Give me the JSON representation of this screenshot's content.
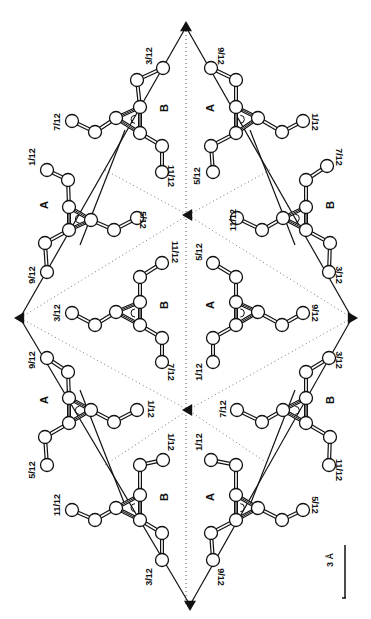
{
  "figure": {
    "width": 371,
    "height": 619
  },
  "axes_3fold": [
    {
      "x": 186,
      "y": 27,
      "dir": "up"
    },
    {
      "x": 20,
      "y": 318,
      "dir": "left"
    },
    {
      "x": 352,
      "y": 318,
      "dir": "right"
    },
    {
      "x": 188,
      "y": 215,
      "dir": "left"
    },
    {
      "x": 188,
      "y": 410,
      "dir": "left"
    },
    {
      "x": 190,
      "y": 605,
      "dir": "down"
    }
  ],
  "cell_lines": [
    [
      186,
      27,
      20,
      318
    ],
    [
      186,
      27,
      352,
      318
    ],
    [
      20,
      318,
      190,
      605
    ],
    [
      352,
      318,
      190,
      605
    ],
    [
      125,
      130,
      80,
      245
    ],
    [
      250,
      130,
      295,
      245
    ],
    [
      80,
      390,
      125,
      505
    ],
    [
      295,
      390,
      250,
      505
    ]
  ],
  "symmetry_lines": [
    [
      186,
      27,
      186,
      605
    ],
    [
      20,
      318,
      188,
      215
    ],
    [
      352,
      318,
      188,
      215
    ],
    [
      20,
      318,
      188,
      410
    ],
    [
      352,
      318,
      188,
      410
    ],
    [
      105,
      170,
      188,
      215
    ],
    [
      270,
      170,
      188,
      215
    ],
    [
      105,
      465,
      188,
      410
    ],
    [
      270,
      465,
      188,
      410
    ]
  ],
  "molecules": [
    {
      "id": "top-left-B",
      "label": "B",
      "labelPos": [
        168,
        108
      ],
      "core": [
        140,
        120
      ],
      "flip": 1,
      "rot": 0,
      "atoms": [
        [
          163,
          68
        ],
        [
          137,
          80
        ],
        [
          140,
          107
        ],
        [
          116,
          118
        ],
        [
          95,
          132
        ],
        [
          72,
          121
        ],
        [
          140,
          133
        ],
        [
          162,
          146
        ],
        [
          162,
          172
        ]
      ],
      "bonds": [
        [
          0,
          1
        ],
        [
          1,
          2
        ],
        [
          2,
          3
        ],
        [
          3,
          4
        ],
        [
          4,
          5
        ],
        [
          2,
          6
        ],
        [
          3,
          6
        ],
        [
          6,
          7
        ],
        [
          7,
          8
        ]
      ]
    },
    {
      "id": "top-right-A",
      "label": "A",
      "labelPos": [
        214,
        108
      ],
      "core": [
        238,
        120
      ],
      "flip": -1,
      "rot": 0,
      "atoms": [
        [
          211,
          68
        ],
        [
          236,
          80
        ],
        [
          236,
          107
        ],
        [
          258,
          118
        ],
        [
          282,
          132
        ],
        [
          303,
          121
        ],
        [
          236,
          133
        ],
        [
          211,
          146
        ],
        [
          213,
          172
        ]
      ],
      "bonds": [
        [
          0,
          1
        ],
        [
          1,
          2
        ],
        [
          2,
          3
        ],
        [
          3,
          4
        ],
        [
          4,
          5
        ],
        [
          2,
          6
        ],
        [
          3,
          6
        ],
        [
          6,
          7
        ],
        [
          7,
          8
        ]
      ]
    },
    {
      "id": "mid-left-A",
      "label": "A",
      "labelPos": [
        48,
        205
      ],
      "core": [
        72,
        215
      ],
      "flip": 1,
      "rot": 0,
      "atoms": [
        [
          47,
          170
        ],
        [
          68,
          180
        ],
        [
          69,
          207
        ],
        [
          91,
          220
        ],
        [
          114,
          230
        ],
        [
          137,
          218
        ],
        [
          69,
          230
        ],
        [
          45,
          243
        ],
        [
          47,
          272
        ]
      ],
      "bonds": [
        [
          0,
          1
        ],
        [
          1,
          2
        ],
        [
          2,
          3
        ],
        [
          3,
          4
        ],
        [
          4,
          5
        ],
        [
          2,
          6
        ],
        [
          3,
          6
        ],
        [
          6,
          7
        ],
        [
          7,
          8
        ]
      ]
    },
    {
      "id": "mid-right-B",
      "label": "B",
      "labelPos": [
        334,
        205
      ],
      "core": [
        298,
        215
      ],
      "flip": -1,
      "rot": 0,
      "atoms": [
        [
          327,
          166
        ],
        [
          306,
          180
        ],
        [
          306,
          207
        ],
        [
          283,
          218
        ],
        [
          262,
          230
        ],
        [
          237,
          218
        ],
        [
          306,
          230
        ],
        [
          330,
          243
        ],
        [
          329,
          272
        ]
      ],
      "bonds": [
        [
          0,
          1
        ],
        [
          1,
          2
        ],
        [
          2,
          3
        ],
        [
          3,
          4
        ],
        [
          4,
          5
        ],
        [
          2,
          6
        ],
        [
          3,
          6
        ],
        [
          6,
          7
        ],
        [
          7,
          8
        ]
      ]
    },
    {
      "id": "center-B",
      "label": "B",
      "labelPos": [
        168,
        305
      ],
      "core": [
        135,
        310
      ],
      "flip": 1,
      "rot": 0,
      "atoms": [
        [
          162,
          263
        ],
        [
          140,
          277
        ],
        [
          140,
          302
        ],
        [
          116,
          312
        ],
        [
          95,
          325
        ],
        [
          72,
          313
        ],
        [
          140,
          325
        ],
        [
          162,
          338
        ],
        [
          162,
          362
        ]
      ],
      "bonds": [
        [
          0,
          1
        ],
        [
          1,
          2
        ],
        [
          2,
          3
        ],
        [
          3,
          4
        ],
        [
          4,
          5
        ],
        [
          2,
          6
        ],
        [
          3,
          6
        ],
        [
          6,
          7
        ],
        [
          7,
          8
        ]
      ]
    },
    {
      "id": "center-A",
      "label": "A",
      "labelPos": [
        214,
        305
      ],
      "core": [
        238,
        310
      ],
      "flip": -1,
      "rot": 0,
      "atoms": [
        [
          213,
          263
        ],
        [
          236,
          277
        ],
        [
          236,
          302
        ],
        [
          258,
          312
        ],
        [
          282,
          325
        ],
        [
          303,
          313
        ],
        [
          236,
          325
        ],
        [
          213,
          338
        ],
        [
          213,
          362
        ]
      ],
      "bonds": [
        [
          0,
          1
        ],
        [
          1,
          2
        ],
        [
          2,
          3
        ],
        [
          3,
          4
        ],
        [
          4,
          5
        ],
        [
          2,
          6
        ],
        [
          3,
          6
        ],
        [
          6,
          7
        ],
        [
          7,
          8
        ]
      ]
    },
    {
      "id": "low-left-A",
      "label": "A",
      "labelPos": [
        48,
        400
      ],
      "core": [
        72,
        405
      ],
      "flip": 1,
      "rot": 0,
      "atoms": [
        [
          47,
          358
        ],
        [
          68,
          372
        ],
        [
          69,
          398
        ],
        [
          91,
          410
        ],
        [
          114,
          422
        ],
        [
          137,
          410
        ],
        [
          69,
          423
        ],
        [
          45,
          437
        ],
        [
          47,
          465
        ]
      ],
      "bonds": [
        [
          0,
          1
        ],
        [
          1,
          2
        ],
        [
          2,
          3
        ],
        [
          3,
          4
        ],
        [
          4,
          5
        ],
        [
          2,
          6
        ],
        [
          3,
          6
        ],
        [
          6,
          7
        ],
        [
          7,
          8
        ]
      ]
    },
    {
      "id": "low-right-B",
      "label": "B",
      "labelPos": [
        334,
        400
      ],
      "core": [
        298,
        405
      ],
      "flip": -1,
      "rot": 0,
      "atoms": [
        [
          329,
          358
        ],
        [
          306,
          372
        ],
        [
          306,
          398
        ],
        [
          283,
          410
        ],
        [
          262,
          422
        ],
        [
          237,
          410
        ],
        [
          306,
          423
        ],
        [
          330,
          437
        ],
        [
          329,
          465
        ]
      ],
      "bonds": [
        [
          0,
          1
        ],
        [
          1,
          2
        ],
        [
          2,
          3
        ],
        [
          3,
          4
        ],
        [
          4,
          5
        ],
        [
          2,
          6
        ],
        [
          3,
          6
        ],
        [
          6,
          7
        ],
        [
          7,
          8
        ]
      ]
    },
    {
      "id": "bottom-left-B",
      "label": "B",
      "labelPos": [
        168,
        497
      ],
      "core": [
        140,
        505
      ],
      "flip": 1,
      "rot": 0,
      "atoms": [
        [
          163,
          460
        ],
        [
          140,
          465
        ],
        [
          140,
          495
        ],
        [
          116,
          508
        ],
        [
          95,
          520
        ],
        [
          72,
          510
        ],
        [
          140,
          520
        ],
        [
          162,
          533
        ],
        [
          162,
          560
        ]
      ],
      "bonds": [
        [
          0,
          1
        ],
        [
          1,
          2
        ],
        [
          2,
          3
        ],
        [
          3,
          4
        ],
        [
          4,
          5
        ],
        [
          2,
          6
        ],
        [
          3,
          6
        ],
        [
          6,
          7
        ],
        [
          7,
          8
        ]
      ]
    },
    {
      "id": "bottom-right-A",
      "label": "A",
      "labelPos": [
        214,
        497
      ],
      "core": [
        238,
        505
      ],
      "flip": -1,
      "rot": 0,
      "atoms": [
        [
          211,
          460
        ],
        [
          236,
          465
        ],
        [
          236,
          495
        ],
        [
          258,
          508
        ],
        [
          282,
          520
        ],
        [
          303,
          510
        ],
        [
          236,
          520
        ],
        [
          211,
          533
        ],
        [
          213,
          560
        ]
      ],
      "bonds": [
        [
          0,
          1
        ],
        [
          1,
          2
        ],
        [
          2,
          3
        ],
        [
          3,
          4
        ],
        [
          4,
          5
        ],
        [
          2,
          6
        ],
        [
          3,
          6
        ],
        [
          6,
          7
        ],
        [
          7,
          8
        ]
      ]
    }
  ],
  "height_labels": [
    {
      "text": "3/12",
      "x": 152,
      "y": 56,
      "rot": -90
    },
    {
      "text": "9/12",
      "x": 218,
      "y": 56,
      "rot": 90
    },
    {
      "text": "7/12",
      "x": 60,
      "y": 122,
      "rot": -90
    },
    {
      "text": "1/12",
      "x": 312,
      "y": 122,
      "rot": 90
    },
    {
      "text": "1/12",
      "x": 35,
      "y": 157,
      "rot": -90
    },
    {
      "text": "7/12",
      "x": 336,
      "y": 157,
      "rot": 90
    },
    {
      "text": "11/12",
      "x": 168,
      "y": 176,
      "rot": 90
    },
    {
      "text": "5/12",
      "x": 200,
      "y": 176,
      "rot": -90
    },
    {
      "text": "5/12",
      "x": 140,
      "y": 220,
      "rot": 90
    },
    {
      "text": "11/12",
      "x": 236,
      "y": 220,
      "rot": -90
    },
    {
      "text": "9/12",
      "x": 35,
      "y": 275,
      "rot": -90
    },
    {
      "text": "3/12",
      "x": 336,
      "y": 275,
      "rot": 90
    },
    {
      "text": "11/12",
      "x": 172,
      "y": 252,
      "rot": 90
    },
    {
      "text": "5/12",
      "x": 202,
      "y": 252,
      "rot": -90
    },
    {
      "text": "3/12",
      "x": 60,
      "y": 313,
      "rot": -90
    },
    {
      "text": "9/12",
      "x": 312,
      "y": 313,
      "rot": 90
    },
    {
      "text": "7/12",
      "x": 168,
      "y": 372,
      "rot": 90
    },
    {
      "text": "1/12",
      "x": 202,
      "y": 372,
      "rot": -90
    },
    {
      "text": "9/12",
      "x": 35,
      "y": 360,
      "rot": -90
    },
    {
      "text": "3/12",
      "x": 336,
      "y": 360,
      "rot": 90
    },
    {
      "text": "1/12",
      "x": 148,
      "y": 409,
      "rot": 90
    },
    {
      "text": "7/12",
      "x": 226,
      "y": 409,
      "rot": -90
    },
    {
      "text": "1/12",
      "x": 168,
      "y": 442,
      "rot": 90
    },
    {
      "text": "1/12",
      "x": 202,
      "y": 442,
      "rot": -90
    },
    {
      "text": "5/12",
      "x": 35,
      "y": 470,
      "rot": -90
    },
    {
      "text": "11/12",
      "x": 336,
      "y": 470,
      "rot": 90
    },
    {
      "text": "11/12",
      "x": 60,
      "y": 505,
      "rot": -90
    },
    {
      "text": "5/12",
      "x": 312,
      "y": 505,
      "rot": 90
    },
    {
      "text": "3/12",
      "x": 152,
      "y": 577,
      "rot": -90
    },
    {
      "text": "9/12",
      "x": 218,
      "y": 577,
      "rot": 90
    }
  ],
  "scale_bar": {
    "label": "3 Å",
    "x": 345,
    "y1": 545,
    "y2": 598,
    "labelX": 333,
    "labelY": 560
  }
}
